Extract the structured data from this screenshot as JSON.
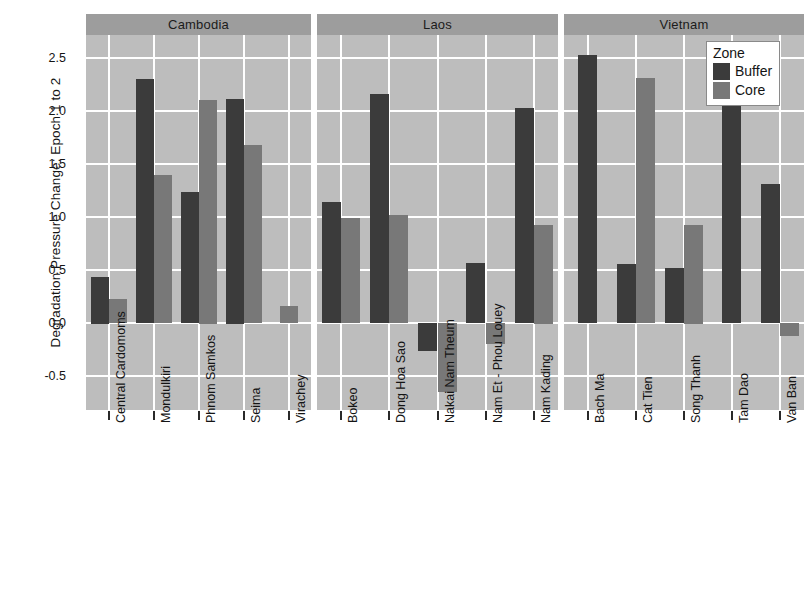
{
  "chart_data": {
    "type": "bar",
    "title": "",
    "xlabel": "",
    "ylabel": "Degradation Pressure Change: Epoch 1 to 2",
    "ylim": [
      -0.82,
      2.72
    ],
    "yticks": [
      -0.5,
      0.0,
      0.5,
      1.0,
      1.5,
      2.0,
      2.5
    ],
    "ytick_labels": [
      "-0.5",
      "0.0",
      "0.5",
      "1.0",
      "1.5",
      "2.0",
      "2.5"
    ],
    "grid": true,
    "legend": {
      "title": "Zone",
      "position": "top-right",
      "entries": [
        {
          "name": "Buffer",
          "color": "#3b3b3b"
        },
        {
          "name": "Core",
          "color": "#787878"
        }
      ]
    },
    "facet_variable": "Country",
    "panels": [
      {
        "name": "Cambodia",
        "categories": [
          "Central Cardomoms",
          "Mondulkiri",
          "Phnom Samkos",
          "Seima",
          "Virachey"
        ],
        "series": [
          {
            "name": "Buffer",
            "color": "#3b3b3b",
            "values": [
              0.44,
              2.3,
              1.24,
              2.12,
              null
            ]
          },
          {
            "name": "Core",
            "color": "#787878",
            "values": [
              0.23,
              1.4,
              2.11,
              1.68,
              0.16
            ]
          }
        ]
      },
      {
        "name": "Laos",
        "categories": [
          "Bokeo",
          "Dong Hoa Sao",
          "Nakai Nam Theum",
          "Nam Et - Phou Louey",
          "Nam Kading"
        ],
        "series": [
          {
            "name": "Buffer",
            "color": "#3b3b3b",
            "values": [
              1.14,
              2.16,
              -0.26,
              0.57,
              2.03
            ]
          },
          {
            "name": "Core",
            "color": "#787878",
            "values": [
              0.99,
              1.02,
              -0.65,
              -0.2,
              0.93
            ]
          }
        ]
      },
      {
        "name": "Vietnam",
        "categories": [
          "Bach Ma",
          "Cat Tien",
          "Song Thanh",
          "Tam Dao",
          "Van Ban"
        ],
        "series": [
          {
            "name": "Buffer",
            "color": "#3b3b3b",
            "values": [
              2.53,
              0.56,
              0.52,
              2.31,
              1.31
            ]
          },
          {
            "name": "Core",
            "color": "#787878",
            "values": [
              null,
              2.31,
              0.93,
              null,
              -0.12
            ]
          }
        ]
      }
    ],
    "colors": {
      "panel_background": "#bdbdbd",
      "strip_background": "#9d9d9d",
      "gridline": "#ffffff",
      "figure_background": "#ffffff",
      "buffer": "#3b3b3b",
      "core": "#787878"
    }
  }
}
